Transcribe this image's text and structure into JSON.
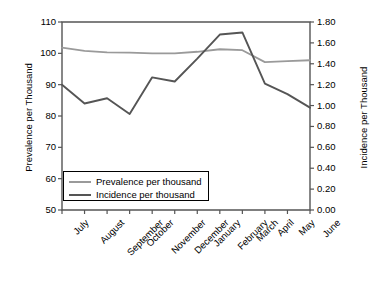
{
  "chart_data": {
    "type": "line",
    "title": "",
    "xlabel": "",
    "ylabel": "Prevalence per Thousand",
    "ylabel_right": "Incidence per Thousand",
    "categories": [
      "July",
      "August",
      "September",
      "October",
      "November",
      "December",
      "January",
      "February",
      "March",
      "April",
      "May",
      "June"
    ],
    "ylim": [
      50,
      110
    ],
    "yticks": [
      50,
      60,
      70,
      80,
      90,
      100,
      110
    ],
    "ytick_labels": [
      "50",
      "60",
      "70",
      "80",
      "90",
      "100",
      "110"
    ],
    "ylim_right": [
      0.0,
      1.8
    ],
    "yticks_right": [
      0.0,
      0.2,
      0.4,
      0.6,
      0.8,
      1.0,
      1.2,
      1.4,
      1.6,
      1.8
    ],
    "ytick_labels_right": [
      "0.00",
      "0.20",
      "0.40",
      "0.60",
      "0.80",
      "1.00",
      "1.20",
      "1.40",
      "1.60",
      "1.80"
    ],
    "grid": false,
    "legend_position": "bottom-left",
    "series": [
      {
        "name": "Prevalence per thousand",
        "axis": "left",
        "color": "#9a9a9a",
        "values": [
          101.8,
          100.8,
          100.3,
          100.2,
          100.0,
          100.0,
          100.5,
          101.3,
          101.0,
          97.2,
          97.5,
          97.8
        ]
      },
      {
        "name": "Incidence per thousand",
        "axis": "right",
        "color": "#555555",
        "values": [
          1.2,
          1.02,
          1.07,
          0.92,
          1.27,
          1.23,
          1.45,
          1.68,
          1.7,
          1.21,
          1.11,
          0.98
        ]
      }
    ]
  },
  "legend": {
    "items": [
      {
        "label": "Prevalence per thousand",
        "color": "#9a9a9a"
      },
      {
        "label": "Incidence per thousand",
        "color": "#555555"
      }
    ]
  },
  "axes": {
    "left_title": "Prevalence per Thousand",
    "right_title": "Incidence per Thousand"
  }
}
